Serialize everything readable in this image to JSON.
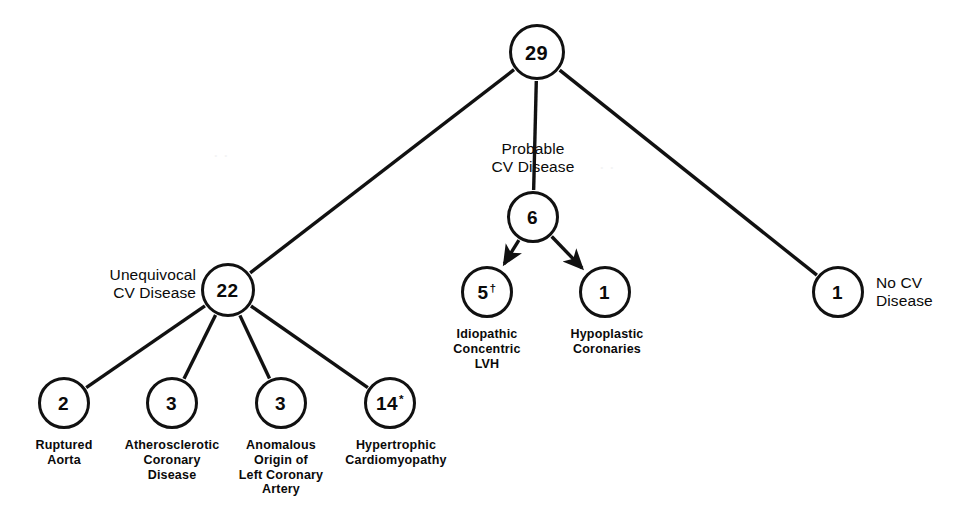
{
  "figure": {
    "type": "tree-diagram",
    "title": "",
    "caption": "",
    "stroke_color": "#111111",
    "background_color": "#ffffff"
  },
  "nodes": {
    "root": {
      "value": "29",
      "sup": "",
      "cx": 537,
      "cy": 52,
      "r": 28,
      "font": 20
    },
    "unequivocal": {
      "value": "22",
      "sup": "",
      "cx": 228,
      "cy": 290,
      "r": 27,
      "font": 19
    },
    "probable": {
      "value": "6",
      "sup": "",
      "cx": 533,
      "cy": 217,
      "r": 26,
      "font": 19
    },
    "nocv": {
      "value": "1",
      "sup": "",
      "cx": 838,
      "cy": 292,
      "r": 26,
      "font": 19
    },
    "idiopathic": {
      "value": "5",
      "sup": "†",
      "cx": 487,
      "cy": 292,
      "r": 26,
      "font": 19
    },
    "hypoplastic": {
      "value": "1",
      "sup": "",
      "cx": 605,
      "cy": 292,
      "r": 26,
      "font": 19
    },
    "ruptured": {
      "value": "2",
      "sup": "",
      "cx": 64,
      "cy": 403,
      "r": 26,
      "font": 19
    },
    "atherosclerotic": {
      "value": "3",
      "sup": "",
      "cx": 172,
      "cy": 403,
      "r": 26,
      "font": 19
    },
    "anomalous": {
      "value": "3",
      "sup": "",
      "cx": 281,
      "cy": 403,
      "r": 26,
      "font": 19
    },
    "hypertrophic": {
      "value": "14",
      "sup": "*",
      "cx": 390,
      "cy": 403,
      "r": 26,
      "font": 19
    }
  },
  "labels": {
    "probable_cv_disease": {
      "text": "Probable\nCV Disease",
      "x": 533,
      "y": 140,
      "align": "ctr",
      "style": "light"
    },
    "unequivocal_cv_disease": {
      "text": "Unequivocal\nCV Disease",
      "x": 196,
      "y": 266,
      "align": "rgt",
      "style": "light"
    },
    "no_cv_disease": {
      "text": "No CV\nDisease",
      "x": 876,
      "y": 274,
      "align": "lft",
      "style": "light"
    },
    "idiopathic_concentric_lvh": {
      "text": "Idiopathic\nConcentric\nLVH",
      "x": 487,
      "y": 327,
      "align": "ctr",
      "style": "heavy"
    },
    "hypoplastic_coronaries": {
      "text": "Hypoplastic\nCoronaries",
      "x": 607,
      "y": 327,
      "align": "ctr",
      "style": "heavy"
    },
    "ruptured_aorta": {
      "text": "Ruptured\nAorta",
      "x": 64,
      "y": 438,
      "align": "ctr",
      "style": "heavy"
    },
    "atherosclerotic_coronary_disease": {
      "text": "Atherosclerotic\nCoronary\nDisease",
      "x": 172,
      "y": 438,
      "align": "ctr",
      "style": "heavy"
    },
    "anomalous_origin_left_coronary_artery": {
      "text": "Anomalous\nOrigin of\nLeft Coronary\nArtery",
      "x": 281,
      "y": 438,
      "align": "ctr",
      "style": "heavy"
    },
    "hypertrophic_cardiomyopathy": {
      "text": "Hypertrophic\nCardiomyopathy",
      "x": 396,
      "y": 438,
      "align": "ctr",
      "style": "heavy"
    }
  },
  "edges": [
    {
      "name": "root-to-unequivocal",
      "from": "root",
      "to": "unequivocal",
      "arrow": false
    },
    {
      "name": "root-to-probable",
      "from": "root",
      "to": "probable",
      "arrow": false
    },
    {
      "name": "root-to-nocv",
      "from": "root",
      "to": "nocv",
      "arrow": false
    },
    {
      "name": "probable-to-idiopathic",
      "from": "probable",
      "to": "idiopathic",
      "arrow": true
    },
    {
      "name": "probable-to-hypoplastic",
      "from": "probable",
      "to": "hypoplastic",
      "arrow": true
    },
    {
      "name": "unequivocal-to-ruptured",
      "from": "unequivocal",
      "to": "ruptured",
      "arrow": false
    },
    {
      "name": "unequivocal-to-atherosclerotic",
      "from": "unequivocal",
      "to": "atherosclerotic",
      "arrow": false
    },
    {
      "name": "unequivocal-to-anomalous",
      "from": "unequivocal",
      "to": "anomalous",
      "arrow": false
    },
    {
      "name": "unequivocal-to-hypertrophic",
      "from": "unequivocal",
      "to": "hypertrophic",
      "arrow": false
    }
  ],
  "artifacts": {
    "faint_mark_top": "· ·",
    "faint_mark_mid": "· ·"
  }
}
